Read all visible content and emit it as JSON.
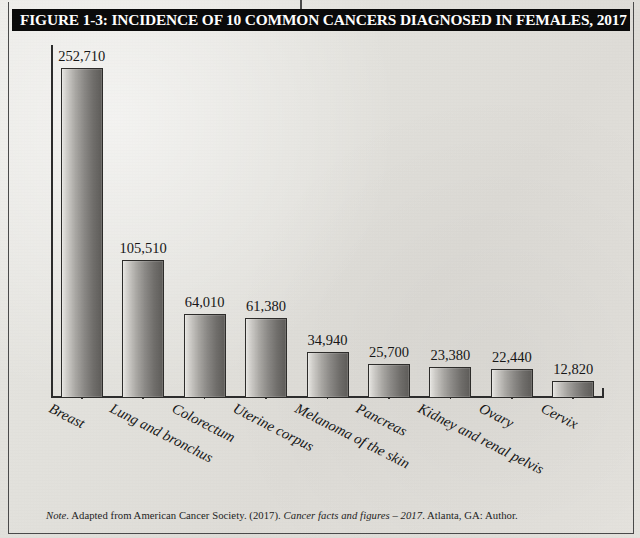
{
  "figure": {
    "title": "FIGURE 1-3: INCIDENCE OF 10 COMMON CANCERS DIAGNOSED IN FEMALES, 2017",
    "note_label": "Note.",
    "note_body_1": " Adapted from American Cancer Society. (2017). ",
    "note_source_italic": "Cancer facts and figures – 2017",
    "note_body_2": ". Atlanta, GA: Author.",
    "colors": {
      "title_bar_background": "#0a0a0a",
      "title_text": "#ffffff",
      "axis": "#2c2c2c",
      "bar_light": "#e7e6e2",
      "bar_dark": "#5e5c59",
      "bar_border": "#2d2c2a",
      "page_background": "#e4e2dd"
    }
  },
  "chart_data": {
    "type": "bar",
    "title": "FIGURE 1-3: INCIDENCE OF 10 COMMON CANCERS DIAGNOSED IN FEMALES, 2017",
    "xlabel": "",
    "ylabel": "",
    "ylim": [
      0,
      270000
    ],
    "grid": false,
    "legend": "none",
    "axis_tick_labels": [],
    "categories": [
      "Breast",
      "Lung and bronchus",
      "Colorectum",
      "Uterine corpus",
      "Melanoma of the skin",
      "Pancreas",
      "Kidney and renal pelvis",
      "Ovary",
      "Cervix"
    ],
    "values": [
      252710,
      105510,
      64010,
      61380,
      34940,
      25700,
      23380,
      22440,
      12820
    ],
    "value_labels": [
      "252,710",
      "105,510",
      "64,010",
      "61,380",
      "34,940",
      "25,700",
      "23,380",
      "22,440",
      "12,820"
    ]
  }
}
